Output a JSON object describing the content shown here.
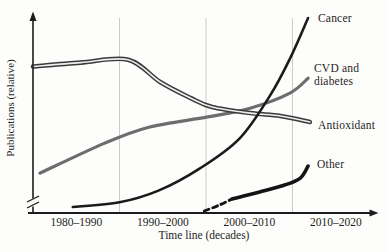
{
  "figure": {
    "background": "#fdfdfb",
    "axis_color": "#1c1c1c",
    "grid_color": "#cbcbcb",
    "text_color": "#262626"
  },
  "chart_data": {
    "type": "line",
    "title": "",
    "xlabel": "Time line (decades)",
    "ylabel": "Publications (relative)",
    "categories": [
      "1980–1990",
      "1990–2000",
      "2000–2010",
      "2010–2020"
    ],
    "xlim": [
      0,
      4
    ],
    "ylim": [
      0,
      100
    ],
    "grid_x": [
      1,
      2,
      3
    ],
    "grid": "vertical separators between decade bins",
    "y_axis_break": true,
    "axis_arrows": true,
    "legend_position": "labels at right ends of lines",
    "series": [
      {
        "name": "CVD and diabetes",
        "color": "#6d6d6d",
        "width": 3.2,
        "line_style": "solid",
        "x": [
          0.08,
          0.83,
          1.35,
          2.02,
          2.51,
          2.97,
          3.18
        ],
        "y": [
          20.0,
          35.5,
          43.8,
          49.0,
          53.5,
          61.3,
          69.0
        ]
      },
      {
        "name": "Antioxidant",
        "color": "#3a3a3a",
        "core_color": "#ededed",
        "width": 4.6,
        "core_width": 1.7,
        "line_style": "outlined-double",
        "x": [
          0.0,
          0.55,
          1.1,
          1.47,
          1.82,
          2.07,
          2.51,
          2.86,
          3.2
        ],
        "y": [
          75.0,
          77.0,
          78.5,
          67.0,
          58.8,
          54.1,
          51.0,
          49.5,
          46.4
        ]
      },
      {
        "name": "Cancer",
        "color": "#1b1b1b",
        "width": 2.6,
        "line_style": "solid",
        "x": [
          0.46,
          1.0,
          1.45,
          1.93,
          2.39,
          2.74,
          2.97,
          3.18
        ],
        "y": [
          2.6,
          5.0,
          11.0,
          22.5,
          38.0,
          60.0,
          79.0,
          100.0
        ]
      },
      {
        "name": "Other",
        "color": "#141414",
        "width": 3.6,
        "line_style": "solid with dashed start",
        "dash_x": [
          1.98,
          2.15,
          2.3
        ],
        "dash_y": [
          0.5,
          3.5,
          6.7
        ],
        "x": [
          2.3,
          2.62,
          2.91,
          3.09,
          3.18
        ],
        "y": [
          6.7,
          10.3,
          13.9,
          17.5,
          23.7
        ]
      }
    ]
  }
}
